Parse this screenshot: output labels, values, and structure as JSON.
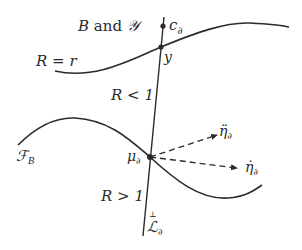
{
  "diagram": {
    "labels": {
      "top_region": "B and 𝒴",
      "top_region_B": "B",
      "top_region_and": " and ",
      "top_region_Y": "𝒴",
      "upper_curve": "R = r",
      "point_c": "c",
      "point_c_sub": "∂",
      "point_y": "y",
      "region_middle": "R < 1",
      "lower_curve": "ℱ",
      "lower_curve_sub": "B",
      "point_mu": "μ",
      "point_mu_sub": "∂",
      "arrow_upper": "η̈",
      "arrow_upper_sub": "∂",
      "arrow_lower": "η̇",
      "arrow_lower_sub": "∂",
      "region_bottom": "R > 1",
      "line_label": "ℒ",
      "line_label_sup": "⊥",
      "line_label_sub": "∂"
    },
    "colors": {
      "stroke": "#2a2a2a",
      "background": "#ffffff"
    }
  }
}
